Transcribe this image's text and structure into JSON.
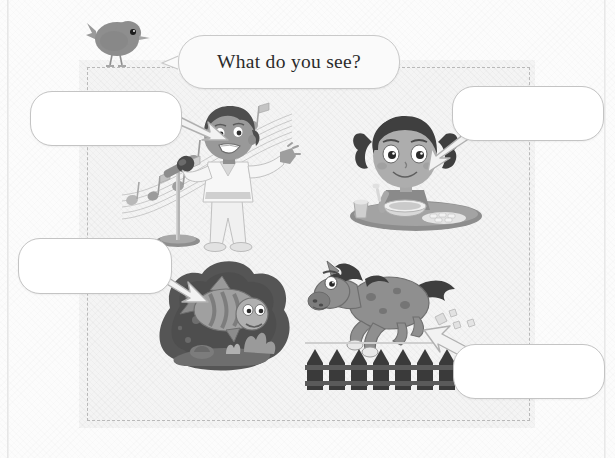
{
  "worksheet": {
    "title_prompt": "What do you see?",
    "character": "bird",
    "instruction_bubble_label": "What do you see?",
    "answer_boxes": [
      {
        "id": "answer-1",
        "value": "",
        "placeholder": "",
        "points_to": "singing-boy"
      },
      {
        "id": "answer-2",
        "value": "",
        "placeholder": "",
        "points_to": "eating-girl"
      },
      {
        "id": "answer-3",
        "value": "",
        "placeholder": "",
        "points_to": "swimming-fish"
      },
      {
        "id": "answer-4",
        "value": "",
        "placeholder": "",
        "points_to": "running-horse"
      }
    ],
    "illustrations": [
      {
        "id": "singing-boy",
        "name": "boy-singing-into-microphone",
        "elements": [
          "music-notes",
          "microphone",
          "boy"
        ]
      },
      {
        "id": "eating-girl",
        "name": "girl-eating-at-table",
        "elements": [
          "girl-with-pigtails",
          "bowl",
          "cup",
          "food"
        ]
      },
      {
        "id": "swimming-fish",
        "name": "fish-swimming-underwater",
        "elements": [
          "fish",
          "coral",
          "bubbles",
          "water"
        ]
      },
      {
        "id": "running-horse",
        "name": "horse-running-over-fence",
        "elements": [
          "horse",
          "fence",
          "dust"
        ]
      }
    ],
    "arrows": [
      {
        "id": "arrow-1",
        "direction": "down-right"
      },
      {
        "id": "arrow-2",
        "direction": "down-left"
      },
      {
        "id": "arrow-3",
        "direction": "down-right"
      },
      {
        "id": "arrow-4",
        "direction": "up-left"
      }
    ],
    "colors": {
      "page_background": "#fcfcfc",
      "panel_background": "#f4f4f4",
      "dashed_border": "#b9b9b9",
      "box_border": "#c4c4c4",
      "box_fill": "#ffffff",
      "text": "#2b2b2b",
      "arrow_fill": "#f2f2f2",
      "arrow_stroke": "#b0b0b0",
      "bird_body": "#8c8c8c",
      "fish_water": "#4e4e4e",
      "horse_body": "#8a8a8a",
      "fence": "#3a3a3a"
    }
  }
}
